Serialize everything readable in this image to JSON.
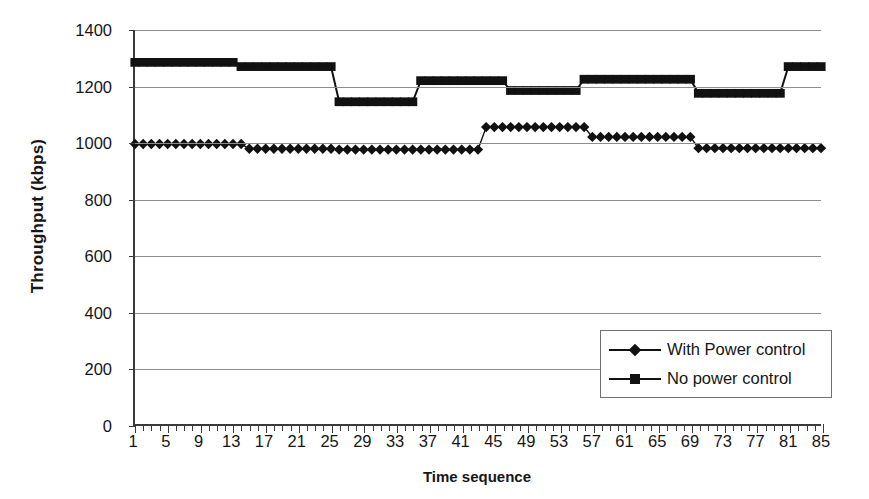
{
  "chart_data": {
    "type": "line",
    "title": "",
    "xlabel": "Time sequence",
    "ylabel": "Throughput (kbps)",
    "xlim": [
      1,
      85
    ],
    "ylim": [
      0,
      1400
    ],
    "ytick_step": 200,
    "xtick_step": 4,
    "grid": true,
    "legend_position": "lower-right",
    "y_ticks": [
      0,
      200,
      400,
      600,
      800,
      1000,
      1200,
      1400
    ],
    "x_ticks": [
      1,
      5,
      9,
      13,
      17,
      21,
      25,
      29,
      33,
      37,
      41,
      45,
      49,
      53,
      57,
      61,
      65,
      69,
      73,
      77,
      81,
      85
    ],
    "x": [
      1,
      2,
      3,
      4,
      5,
      6,
      7,
      8,
      9,
      10,
      11,
      12,
      13,
      14,
      15,
      16,
      17,
      18,
      19,
      20,
      21,
      22,
      23,
      24,
      25,
      26,
      27,
      28,
      29,
      30,
      31,
      32,
      33,
      34,
      35,
      36,
      37,
      38,
      39,
      40,
      41,
      42,
      43,
      44,
      45,
      46,
      47,
      48,
      49,
      50,
      51,
      52,
      53,
      54,
      55,
      56,
      57,
      58,
      59,
      60,
      61,
      62,
      63,
      64,
      65,
      66,
      67,
      68,
      69,
      70,
      71,
      72,
      73,
      74,
      75,
      76,
      77,
      78,
      79,
      80,
      81,
      82,
      83,
      84,
      85
    ],
    "series": [
      {
        "name": "With Power control",
        "marker": "diamond",
        "color": "#111111",
        "values": [
          995,
          995,
          995,
          995,
          995,
          995,
          995,
          995,
          995,
          995,
          995,
          995,
          995,
          995,
          978,
          978,
          978,
          978,
          978,
          978,
          978,
          978,
          978,
          978,
          978,
          975,
          975,
          975,
          975,
          975,
          975,
          975,
          975,
          975,
          975,
          975,
          975,
          975,
          975,
          975,
          975,
          975,
          975,
          1055,
          1055,
          1055,
          1055,
          1055,
          1055,
          1055,
          1055,
          1055,
          1055,
          1055,
          1055,
          1055,
          1020,
          1020,
          1020,
          1020,
          1020,
          1020,
          1020,
          1020,
          1020,
          1020,
          1020,
          1020,
          1020,
          980,
          980,
          980,
          980,
          980,
          980,
          980,
          980,
          980,
          980,
          980,
          980,
          980,
          980,
          980,
          980
        ]
      },
      {
        "name": "No power control",
        "marker": "square",
        "color": "#111111",
        "values": [
          1285,
          1285,
          1285,
          1285,
          1285,
          1285,
          1285,
          1285,
          1285,
          1285,
          1285,
          1285,
          1285,
          1270,
          1270,
          1270,
          1270,
          1270,
          1270,
          1270,
          1270,
          1270,
          1270,
          1270,
          1270,
          1145,
          1145,
          1145,
          1145,
          1145,
          1145,
          1145,
          1145,
          1145,
          1145,
          1220,
          1220,
          1220,
          1220,
          1220,
          1220,
          1220,
          1220,
          1220,
          1220,
          1220,
          1185,
          1185,
          1185,
          1185,
          1185,
          1185,
          1185,
          1185,
          1185,
          1225,
          1225,
          1225,
          1225,
          1225,
          1225,
          1225,
          1225,
          1225,
          1225,
          1225,
          1225,
          1225,
          1225,
          1175,
          1175,
          1175,
          1175,
          1175,
          1175,
          1175,
          1175,
          1175,
          1175,
          1175,
          1270,
          1270,
          1270,
          1270,
          1270
        ]
      }
    ]
  },
  "legend": {
    "items": [
      {
        "label": "With Power control"
      },
      {
        "label": "No power control"
      }
    ]
  }
}
